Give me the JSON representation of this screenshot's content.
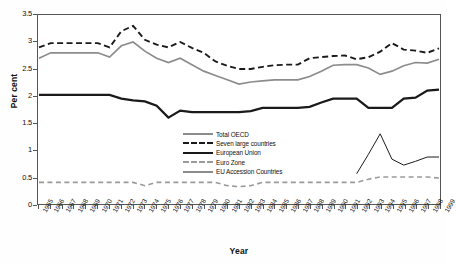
{
  "chart_data": {
    "type": "line",
    "title": "",
    "xlabel": "Year",
    "ylabel": "Per cent",
    "ylim": [
      0,
      3.5
    ],
    "ytick_labels": [
      "0",
      "0.5",
      "1",
      "1.5",
      "2",
      "2.5",
      "3",
      "3.5"
    ],
    "ytick_values": [
      0,
      0.5,
      1,
      1.5,
      2,
      2.5,
      3,
      3.5
    ],
    "grid": false,
    "legend_position": "center",
    "categories": [
      "1965",
      "1966",
      "1967",
      "1968",
      "1969",
      "1970",
      "1971",
      "1972",
      "1973",
      "1974",
      "1975",
      "1976",
      "1977",
      "1978",
      "1979",
      "1980",
      "1981",
      "1982",
      "1983",
      "1984",
      "1985",
      "1986",
      "1987",
      "1988",
      "1989",
      "1990",
      "1991",
      "1992",
      "1993",
      "1994",
      "1995",
      "1996",
      "1997",
      "1998",
      "1999"
    ],
    "series": [
      {
        "name": "Total OECD",
        "style": "solid",
        "color": "#8c8c8c",
        "width": 1.7,
        "values": [
          2.7,
          2.8,
          2.8,
          2.8,
          2.8,
          2.8,
          2.72,
          2.93,
          3.0,
          2.83,
          2.7,
          2.62,
          2.7,
          2.58,
          2.46,
          2.38,
          2.3,
          2.22,
          2.26,
          2.28,
          2.3,
          2.3,
          2.3,
          2.36,
          2.46,
          2.57,
          2.58,
          2.58,
          2.52,
          2.4,
          2.46,
          2.56,
          2.62,
          2.61,
          2.68
        ]
      },
      {
        "name": "Seven large countries",
        "style": "dashed",
        "color": "#1a1a1a",
        "width": 1.9,
        "values": [
          2.9,
          2.98,
          2.98,
          2.98,
          2.98,
          2.98,
          2.9,
          3.2,
          3.3,
          3.04,
          2.95,
          2.9,
          3.0,
          2.89,
          2.8,
          2.64,
          2.56,
          2.5,
          2.5,
          2.54,
          2.57,
          2.58,
          2.58,
          2.7,
          2.72,
          2.74,
          2.75,
          2.68,
          2.72,
          2.82,
          2.98,
          2.86,
          2.84,
          2.8,
          2.88
        ]
      },
      {
        "name": "European Union",
        "style": "solid",
        "color": "#1a1a1a",
        "width": 2.3,
        "values": [
          2.02,
          2.02,
          2.02,
          2.02,
          2.02,
          2.02,
          2.02,
          1.95,
          1.92,
          1.9,
          1.82,
          1.6,
          1.73,
          1.7,
          1.7,
          1.7,
          1.7,
          1.7,
          1.72,
          1.78,
          1.78,
          1.78,
          1.78,
          1.8,
          1.88,
          1.95,
          1.95,
          1.95,
          1.78,
          1.78,
          1.78,
          1.95,
          1.97,
          2.1,
          2.12
        ]
      },
      {
        "name": "Euro Zone",
        "style": "dashed",
        "color": "#9a9a9a",
        "width": 1.6,
        "values": [
          0.4,
          0.4,
          0.4,
          0.4,
          0.4,
          0.4,
          0.4,
          0.4,
          0.4,
          0.34,
          0.4,
          0.4,
          0.4,
          0.4,
          0.4,
          0.4,
          0.34,
          0.32,
          0.34,
          0.4,
          0.4,
          0.4,
          0.4,
          0.4,
          0.4,
          0.4,
          0.4,
          0.4,
          0.46,
          0.5,
          0.5,
          0.5,
          0.5,
          0.5,
          0.48
        ]
      },
      {
        "name": "EU Accession Countries",
        "style": "solid",
        "color": "#1a1a1a",
        "width": 1.0,
        "values": [
          null,
          null,
          null,
          null,
          null,
          null,
          null,
          null,
          null,
          null,
          null,
          null,
          null,
          null,
          null,
          null,
          null,
          null,
          null,
          null,
          null,
          null,
          null,
          null,
          null,
          null,
          null,
          0.56,
          0.92,
          1.3,
          0.83,
          0.72,
          0.79,
          0.87,
          0.87
        ]
      }
    ]
  },
  "axes": {
    "y_title": "Per cent",
    "x_title": "Year"
  },
  "legend": {
    "items": [
      {
        "label": "Total OECD"
      },
      {
        "label": "Seven large countries"
      },
      {
        "label": "European Union"
      },
      {
        "label": "Euro Zone"
      },
      {
        "label": "EU Accession Countries"
      }
    ]
  }
}
